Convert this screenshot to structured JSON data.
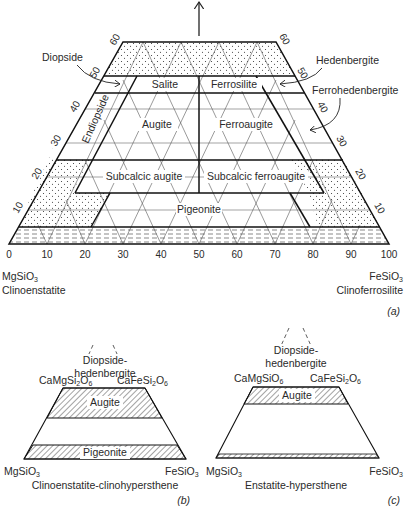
{
  "figure": {
    "panel_a": {
      "panel_label": "(a)",
      "field_labels": {
        "salite": "Salite",
        "ferrosilite": "Ferrosilite",
        "augite": "Augite",
        "ferroaugite": "Ferroaugite",
        "subcalcic_augite": "Subcalcic augite",
        "subcalcic_ferroaugite": "Subcalcic ferroaugite",
        "pigeonite": "Pigeonite",
        "endiopside": "Endiopside"
      },
      "callouts": {
        "diopside": "Diopside",
        "hedenbergite": "Hedenbergite",
        "ferrohedenbergite": "Ferrohedenbergite"
      },
      "base_ticks": [
        "0",
        "10",
        "20",
        "30",
        "40",
        "50",
        "60",
        "70",
        "80",
        "90",
        "100"
      ],
      "side_ticks": [
        "10",
        "20",
        "30",
        "40",
        "50",
        "60"
      ],
      "left_endmember": {
        "formula": "MgSiO",
        "subscript": "3",
        "name": "Clinoenstatite"
      },
      "right_endmember": {
        "formula": "FeSiO",
        "subscript": "3",
        "name": "Clinoferrosilite"
      }
    },
    "panel_b": {
      "panel_label": "(b)",
      "top_label_line1": "Diopside-",
      "top_label_line2": "hedenbergite",
      "top_left": {
        "formula": "CaMgSi",
        "s1": "2",
        "f2": "O",
        "s2": "6"
      },
      "top_right": {
        "formula": "CaFeSi",
        "s1": "2",
        "f2": "O",
        "s2": "6"
      },
      "augite": "Augite",
      "pigeonite": "Pigeonite",
      "bottom_left": {
        "formula": "MgSiO",
        "subscript": "3"
      },
      "bottom_right": {
        "formula": "FeSiO",
        "subscript": "3"
      },
      "series_name": "Clinoenstatite-clinohypersthene"
    },
    "panel_c": {
      "panel_label": "(c)",
      "top_label_line1": "Diopside-",
      "top_label_line2": "hedenbergite",
      "top_left": {
        "formula": "CaMgSiO",
        "s1": "6"
      },
      "top_right": {
        "formula": "CaFeSi",
        "s1": "2",
        "f2": "O",
        "s2": "6"
      },
      "augite": "Augite",
      "bottom_left": {
        "formula": "MgSiO",
        "subscript": "3"
      },
      "bottom_right": {
        "formula": "FeSiO",
        "subscript": "3"
      },
      "series_name": "Enstatite-hypersthene"
    }
  }
}
